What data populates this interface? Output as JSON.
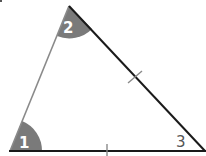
{
  "diagram": {
    "type": "triangle",
    "colors": {
      "line_dark": "#1a1a1a",
      "line_gray": "#8a8a8a",
      "angle_fill": "#7a7a7a",
      "label_on_fill": "#ffffff",
      "label_plain": "#555555"
    },
    "vertices": {
      "top": [
        69,
        6
      ],
      "bottom_left": [
        10,
        151
      ],
      "bottom_right": [
        205,
        151
      ]
    },
    "angles": [
      {
        "id": "1",
        "label": "1",
        "vertex": "bottom_left",
        "shaded": true
      },
      {
        "id": "2",
        "label": "2",
        "vertex": "top",
        "shaded": true
      },
      {
        "id": "3",
        "label": "3",
        "vertex": "bottom_right",
        "shaded": false
      }
    ],
    "congruence_marks": [
      {
        "side": "top-to-bottom_right",
        "ticks": 1
      },
      {
        "side": "bottom_left-to-bottom_right",
        "ticks": 1
      }
    ],
    "corner_fragment": "."
  }
}
